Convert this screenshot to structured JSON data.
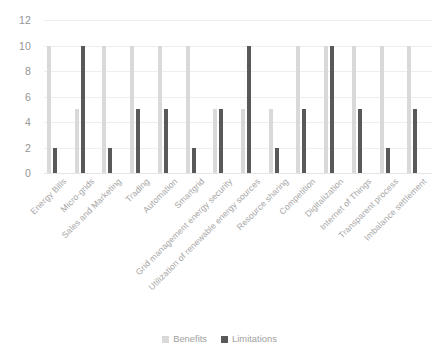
{
  "chart_data": {
    "type": "bar",
    "title": "",
    "subtitle": "",
    "xlabel": "",
    "ylabel": "",
    "ylim": [
      0,
      12
    ],
    "yticks": [
      0,
      2,
      4,
      6,
      8,
      10,
      12
    ],
    "grid": true,
    "legend_position": "bottom",
    "categories": [
      "Energy Bills",
      "Micro-grids",
      "Sales and Marketing",
      "Trading",
      "Automation",
      "Smartgrid",
      "Grid management energy security",
      "Utilization of renewable energy sources",
      "Resource sharing",
      "Competition",
      "Digitalization",
      "Internet of Things",
      "Transparent process",
      "Imbalance settlement"
    ],
    "series": [
      {
        "name": "Benefits",
        "color": "#d9d9d9",
        "values": [
          10,
          5,
          10,
          10,
          10,
          10,
          5,
          5,
          5,
          10,
          10,
          10,
          10,
          10
        ]
      },
      {
        "name": "Limitations",
        "color": "#595959",
        "values": [
          2,
          10,
          2,
          5,
          5,
          2,
          5,
          10,
          2,
          5,
          10,
          5,
          2,
          5
        ]
      }
    ]
  },
  "axis": {
    "y_tick_labels": [
      "0",
      "2",
      "4",
      "6",
      "8",
      "10",
      "12"
    ]
  },
  "legend": {
    "items": [
      {
        "label": "Benefits",
        "color": "#d9d9d9"
      },
      {
        "label": "Limitations",
        "color": "#595959"
      }
    ]
  }
}
